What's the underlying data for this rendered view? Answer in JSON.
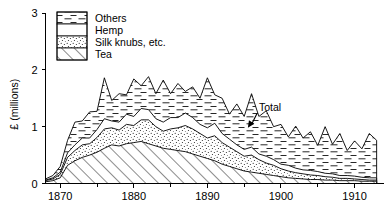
{
  "chart_data": {
    "type": "area",
    "stacked": true,
    "title": "",
    "subtitle": "",
    "xlabel": "",
    "ylabel": "£ (millions)",
    "xlim": [
      1868,
      1914
    ],
    "ylim": [
      0,
      3
    ],
    "grid": false,
    "legend_position": "top-left-inside",
    "x_ticks_major": [
      1870,
      1880,
      1890,
      1900,
      1910
    ],
    "x_tick_labels": [
      "1870",
      "1880",
      "1890",
      "1900",
      "1910"
    ],
    "x_ticks_minor": [
      1875,
      1885,
      1895,
      1905
    ],
    "y_ticks": [
      0,
      1,
      2,
      3
    ],
    "y_tick_labels": [
      "0",
      "1",
      "2",
      "3"
    ],
    "annotations": [
      {
        "text": "Total",
        "x": 1897,
        "y": 1.28,
        "arrow_to_x": 1895.5,
        "arrow_to_y": 0.98
      }
    ],
    "legend": [
      {
        "name": "Others",
        "pattern": "dashed-horizontal"
      },
      {
        "name": "Hemp",
        "pattern": "blank-white"
      },
      {
        "name": "Silk knubs, etc.",
        "pattern": "stipple-dots"
      },
      {
        "name": "Tea",
        "pattern": "diagonal-hatch"
      }
    ],
    "x": [
      1868,
      1869,
      1870,
      1871,
      1872,
      1873,
      1874,
      1875,
      1876,
      1877,
      1878,
      1879,
      1880,
      1881,
      1882,
      1883,
      1884,
      1885,
      1886,
      1887,
      1888,
      1889,
      1890,
      1891,
      1892,
      1893,
      1894,
      1895,
      1896,
      1897,
      1898,
      1899,
      1900,
      1901,
      1902,
      1903,
      1904,
      1905,
      1906,
      1907,
      1908,
      1909,
      1910,
      1911,
      1912,
      1913
    ],
    "series": [
      {
        "name": "Tea",
        "pattern": "diagonal-hatch",
        "values": [
          0.03,
          0.05,
          0.1,
          0.32,
          0.4,
          0.46,
          0.5,
          0.55,
          0.62,
          0.68,
          0.66,
          0.7,
          0.72,
          0.74,
          0.7,
          0.66,
          0.62,
          0.6,
          0.58,
          0.56,
          0.52,
          0.48,
          0.44,
          0.4,
          0.34,
          0.3,
          0.26,
          0.22,
          0.2,
          0.18,
          0.16,
          0.14,
          0.12,
          0.1,
          0.09,
          0.08,
          0.07,
          0.07,
          0.06,
          0.06,
          0.05,
          0.05,
          0.05,
          0.04,
          0.04,
          0.04
        ]
      },
      {
        "name": "Silk knubs, etc.",
        "pattern": "stipple-dots",
        "values": [
          0.02,
          0.03,
          0.06,
          0.14,
          0.18,
          0.22,
          0.2,
          0.26,
          0.34,
          0.3,
          0.28,
          0.34,
          0.3,
          0.38,
          0.42,
          0.34,
          0.3,
          0.36,
          0.4,
          0.46,
          0.44,
          0.4,
          0.36,
          0.44,
          0.38,
          0.34,
          0.3,
          0.26,
          0.3,
          0.24,
          0.2,
          0.18,
          0.14,
          0.12,
          0.1,
          0.09,
          0.08,
          0.07,
          0.06,
          0.05,
          0.04,
          0.04,
          0.03,
          0.03,
          0.02,
          0.02
        ]
      },
      {
        "name": "Hemp",
        "pattern": "blank-white",
        "values": [
          0.01,
          0.02,
          0.04,
          0.08,
          0.1,
          0.12,
          0.1,
          0.14,
          0.18,
          0.12,
          0.14,
          0.18,
          0.16,
          0.2,
          0.18,
          0.14,
          0.16,
          0.2,
          0.18,
          0.22,
          0.2,
          0.16,
          0.18,
          0.22,
          0.16,
          0.14,
          0.12,
          0.12,
          0.14,
          0.1,
          0.12,
          0.1,
          0.08,
          0.1,
          0.08,
          0.07,
          0.08,
          0.07,
          0.06,
          0.06,
          0.05,
          0.05,
          0.05,
          0.04,
          0.04,
          0.04
        ]
      },
      {
        "name": "Others",
        "pattern": "dashed-horizontal",
        "values": [
          0.02,
          0.04,
          0.1,
          0.22,
          0.4,
          0.3,
          0.46,
          0.32,
          0.72,
          0.36,
          0.5,
          0.34,
          0.66,
          0.4,
          0.58,
          0.44,
          0.74,
          0.42,
          0.6,
          0.38,
          0.54,
          0.46,
          0.88,
          0.5,
          0.62,
          0.44,
          0.72,
          0.58,
          0.94,
          0.66,
          0.8,
          0.58,
          0.7,
          0.5,
          0.74,
          0.56,
          0.68,
          0.46,
          0.82,
          0.52,
          0.74,
          0.44,
          0.62,
          0.5,
          0.78,
          0.66
        ]
      }
    ]
  },
  "axes": {
    "y_label": "£ (millions)"
  }
}
